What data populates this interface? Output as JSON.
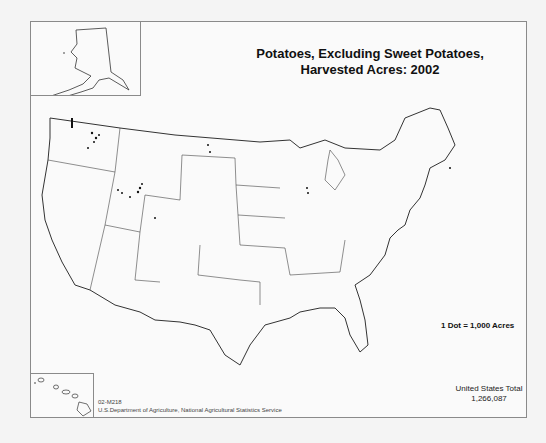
{
  "map": {
    "title_line1": "Potatoes, Excluding Sweet Potatoes,",
    "title_line2": "Harvested Acres:  2002",
    "legend": "1 Dot = 1,000 Acres",
    "total_label": "United States Total",
    "total_value": "1,266,087",
    "map_code": "02-M218",
    "source": "U.S.Department of Agriculture, National Agricultural Statistics Service",
    "insets": [
      "Alaska",
      "Hawaii"
    ],
    "colors": {
      "background": "#fafafa",
      "border": "#8a8a8a",
      "outline": "#333333",
      "dots": "#111111"
    }
  }
}
